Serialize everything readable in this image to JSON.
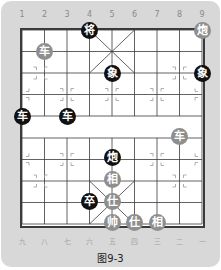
{
  "board": {
    "top_labels": [
      "1",
      "2",
      "3",
      "4",
      "5",
      "6",
      "7",
      "8",
      "9"
    ],
    "bottom_labels": [
      "九",
      "八",
      "七",
      "六",
      "五",
      "四",
      "三",
      "二",
      "一"
    ],
    "caption": "图9-3",
    "colors": {
      "panel": "#d8d8d8",
      "board": "#ffffff",
      "lines": "#3a3a3a",
      "black_piece": "#111111",
      "red_piece": "#8e8e8e"
    }
  },
  "pieces": [
    {
      "char": "将",
      "side": "black",
      "col": 3,
      "row": 0
    },
    {
      "char": "炮",
      "side": "red",
      "col": 8,
      "row": 0
    },
    {
      "char": "车",
      "side": "red",
      "col": 1,
      "row": 1
    },
    {
      "char": "象",
      "side": "black",
      "col": 4,
      "row": 2
    },
    {
      "char": "象",
      "side": "black",
      "col": 8,
      "row": 2
    },
    {
      "char": "车",
      "side": "black",
      "col": 0,
      "row": 4
    },
    {
      "char": "车",
      "side": "black",
      "col": 2,
      "row": 4
    },
    {
      "char": "车",
      "side": "red",
      "col": 7,
      "row": 5
    },
    {
      "char": "炮",
      "side": "black",
      "col": 4,
      "row": 6
    },
    {
      "char": "相",
      "side": "red",
      "col": 4,
      "row": 7
    },
    {
      "char": "卒",
      "side": "black",
      "col": 3,
      "row": 8
    },
    {
      "char": "仕",
      "side": "red",
      "col": 4,
      "row": 8
    },
    {
      "char": "帅",
      "side": "red",
      "col": 4,
      "row": 9
    },
    {
      "char": "仕",
      "side": "red",
      "col": 5,
      "row": 9
    },
    {
      "char": "相",
      "side": "red",
      "col": 6,
      "row": 9
    }
  ]
}
